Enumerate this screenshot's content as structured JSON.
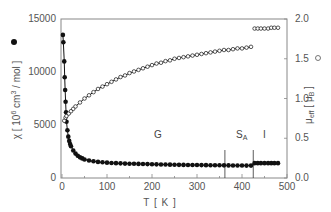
{
  "chart_data": {
    "type": "scatter",
    "title": "",
    "xlabel": "T [ K ]",
    "ylabel_left": "χ [ 10⁶ cm³ / mol ]",
    "ylabel_right": "μeff [ μB ]",
    "xlim": [
      0,
      500
    ],
    "ylim_left": [
      0,
      15000
    ],
    "ylim_right": [
      0.0,
      2.0
    ],
    "x_ticks": [
      0,
      100,
      200,
      300,
      400,
      500
    ],
    "y_left_ticks": [
      0,
      5000,
      10000,
      15000
    ],
    "y_right_ticks": [
      0.0,
      0.5,
      1.0,
      1.5,
      2.0
    ],
    "grid": false,
    "legend": [
      {
        "label": "χ",
        "marker": "filled-circle",
        "axis": "left"
      },
      {
        "label": "μeff",
        "marker": "open-circle",
        "axis": "right"
      }
    ],
    "phase_boundaries": [
      {
        "T": 362,
        "label": "G|SA"
      },
      {
        "T": 425,
        "label": "SA|I"
      }
    ],
    "annotations": [
      {
        "text": "G",
        "T": 210
      },
      {
        "text": "S",
        "sub": "A",
        "T": 395
      },
      {
        "text": "I",
        "T": 450
      }
    ],
    "series": [
      {
        "name": "χ",
        "axis": "left",
        "marker": "filled",
        "x": [
          2,
          3,
          5,
          6,
          7,
          8,
          9,
          10,
          12,
          14,
          16,
          18,
          20,
          25,
          30,
          35,
          40,
          45,
          50,
          60,
          70,
          80,
          90,
          100,
          110,
          120,
          130,
          140,
          150,
          160,
          170,
          180,
          190,
          200,
          210,
          220,
          230,
          240,
          250,
          260,
          270,
          280,
          290,
          300,
          310,
          320,
          330,
          340,
          350,
          360,
          370,
          380,
          390,
          400,
          410,
          420,
          428,
          435,
          442,
          450,
          458,
          465,
          472,
          480
        ],
        "values": [
          13500,
          12800,
          11000,
          9500,
          8300,
          7200,
          6200,
          5300,
          4500,
          3900,
          3500,
          3200,
          3000,
          2600,
          2300,
          2100,
          1950,
          1850,
          1750,
          1650,
          1580,
          1520,
          1480,
          1450,
          1420,
          1400,
          1380,
          1360,
          1350,
          1340,
          1330,
          1320,
          1310,
          1300,
          1290,
          1280,
          1270,
          1260,
          1250,
          1240,
          1235,
          1230,
          1225,
          1220,
          1215,
          1210,
          1205,
          1200,
          1200,
          1195,
          1190,
          1185,
          1180,
          1175,
          1170,
          1170,
          1400,
          1400,
          1400,
          1400,
          1400,
          1400,
          1400,
          1400
        ]
      },
      {
        "name": "μeff",
        "axis": "right",
        "marker": "open",
        "x": [
          5,
          8,
          10,
          15,
          20,
          25,
          30,
          40,
          50,
          60,
          70,
          80,
          90,
          100,
          110,
          120,
          130,
          140,
          150,
          160,
          170,
          180,
          190,
          200,
          210,
          220,
          230,
          240,
          250,
          260,
          270,
          280,
          290,
          300,
          310,
          320,
          330,
          340,
          350,
          360,
          370,
          380,
          390,
          400,
          410,
          420,
          428,
          435,
          442,
          450,
          458,
          465,
          472,
          480
        ],
        "values": [
          0.72,
          0.76,
          0.78,
          0.81,
          0.84,
          0.87,
          0.9,
          0.95,
          1.0,
          1.04,
          1.08,
          1.12,
          1.15,
          1.18,
          1.21,
          1.24,
          1.27,
          1.29,
          1.32,
          1.34,
          1.36,
          1.38,
          1.4,
          1.42,
          1.44,
          1.45,
          1.47,
          1.48,
          1.5,
          1.51,
          1.52,
          1.53,
          1.54,
          1.55,
          1.56,
          1.57,
          1.58,
          1.59,
          1.6,
          1.61,
          1.61,
          1.62,
          1.63,
          1.63,
          1.64,
          1.65,
          1.88,
          1.88,
          1.88,
          1.88,
          1.88,
          1.89,
          1.89,
          1.89
        ]
      }
    ]
  },
  "labels": {
    "x_axis": "T [ K ]",
    "y_left_main": "χ [ 10",
    "y_left_exp": "6",
    "y_left_rest": " cm",
    "y_left_exp2": "3",
    "y_left_end": " / mol ]",
    "y_right_main": "μ",
    "y_right_sub": "eff",
    "y_right_end": " [ μ",
    "y_right_sub2": "B",
    "y_right_close": " ]",
    "region_g": "G",
    "region_sa": "S",
    "region_sa_sub": "A",
    "region_i": "I"
  },
  "colors": {
    "axis": "#888888",
    "data": "#111111",
    "text": "#555555"
  }
}
